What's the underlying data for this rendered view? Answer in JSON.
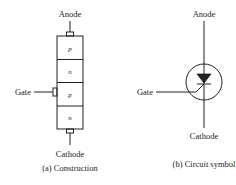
{
  "construction": {
    "anode_label": "Anode",
    "cathode_label": "Cathode",
    "gate_label": "Gate",
    "caption": "(a) Construction",
    "layers": [
      {
        "type": "p"
      },
      {
        "type": "n"
      },
      {
        "type": "p"
      },
      {
        "type": "n"
      }
    ]
  },
  "symbol": {
    "anode_label": "Anode",
    "cathode_label": "Cathode",
    "gate_label": "Gate",
    "caption": "(b) Circuit symbol"
  },
  "colors": {
    "line": "#222222",
    "background": "#ffffff"
  }
}
